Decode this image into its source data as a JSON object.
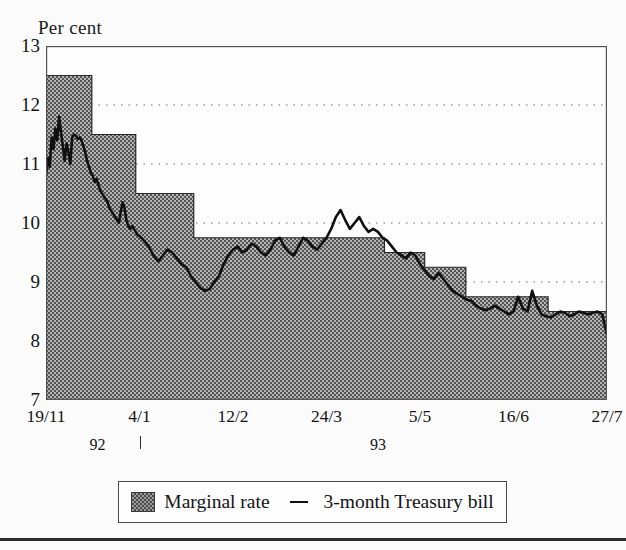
{
  "chart_data": {
    "type": "area",
    "title": "",
    "ylabel": "Per cent",
    "xlabel": "",
    "ylim": [
      7,
      13
    ],
    "yticks": [
      7,
      8,
      9,
      10,
      11,
      12,
      13
    ],
    "ytick_labels": [
      "7",
      "8",
      "9",
      "10",
      "11",
      "12",
      "13"
    ],
    "gridlines": [
      8,
      9,
      10,
      11,
      12
    ],
    "grid": "horizontal-dotted",
    "xtick_labels": [
      "19/11",
      "4/1",
      "12/2",
      "24/3",
      "5/5",
      "16/6",
      "27/7"
    ],
    "xtick_positions": [
      0,
      1,
      2,
      3,
      4,
      5,
      6
    ],
    "year_labels": [
      {
        "text": "92",
        "x": 0.55
      },
      {
        "text": "93",
        "x": 3.55
      }
    ],
    "year_tick_at": 1.0,
    "legend": {
      "position": "below-plot",
      "entries": [
        {
          "label": "Marginal rate",
          "marker": "filled-hatched-square"
        },
        {
          "label": "3-month Treasury bill",
          "marker": "line"
        }
      ]
    },
    "series": [
      {
        "name": "Marginal rate",
        "type": "step-area",
        "fill": "#a0a0a0",
        "steps": [
          {
            "x": 0.0,
            "value": 12.5
          },
          {
            "x": 0.49,
            "value": 11.5
          },
          {
            "x": 0.96,
            "value": 10.5
          },
          {
            "x": 1.58,
            "value": 9.75
          },
          {
            "x": 3.62,
            "value": 9.5
          },
          {
            "x": 4.05,
            "value": 9.25
          },
          {
            "x": 4.49,
            "value": 8.75
          },
          {
            "x": 5.37,
            "value": 8.5
          },
          {
            "x": 6.0,
            "value": 8.5
          }
        ]
      },
      {
        "name": "3-month Treasury bill",
        "type": "line",
        "color": "#101010",
        "x": [
          0.0,
          0.02,
          0.04,
          0.06,
          0.08,
          0.1,
          0.12,
          0.14,
          0.16,
          0.18,
          0.2,
          0.22,
          0.24,
          0.26,
          0.28,
          0.3,
          0.32,
          0.34,
          0.36,
          0.38,
          0.4,
          0.42,
          0.44,
          0.46,
          0.48,
          0.5,
          0.52,
          0.54,
          0.56,
          0.58,
          0.6,
          0.62,
          0.64,
          0.66,
          0.68,
          0.7,
          0.72,
          0.74,
          0.76,
          0.78,
          0.8,
          0.82,
          0.84,
          0.86,
          0.88,
          0.9,
          0.92,
          0.94,
          0.96,
          0.98,
          1.0,
          1.05,
          1.1,
          1.15,
          1.2,
          1.25,
          1.3,
          1.35,
          1.4,
          1.45,
          1.5,
          1.55,
          1.6,
          1.65,
          1.7,
          1.75,
          1.8,
          1.85,
          1.9,
          1.95,
          2.0,
          2.05,
          2.1,
          2.15,
          2.2,
          2.25,
          2.3,
          2.35,
          2.4,
          2.45,
          2.5,
          2.55,
          2.6,
          2.65,
          2.7,
          2.75,
          2.8,
          2.85,
          2.9,
          2.95,
          3.0,
          3.05,
          3.1,
          3.15,
          3.2,
          3.25,
          3.3,
          3.35,
          3.4,
          3.45,
          3.5,
          3.55,
          3.6,
          3.65,
          3.7,
          3.75,
          3.8,
          3.85,
          3.9,
          3.95,
          4.0,
          4.05,
          4.1,
          4.15,
          4.2,
          4.25,
          4.3,
          4.35,
          4.4,
          4.45,
          4.5,
          4.55,
          4.6,
          4.65,
          4.7,
          4.75,
          4.8,
          4.85,
          4.9,
          4.95,
          5.0,
          5.05,
          5.1,
          5.15,
          5.2,
          5.25,
          5.3,
          5.35,
          5.4,
          5.45,
          5.5,
          5.55,
          5.6,
          5.65,
          5.7,
          5.75,
          5.8,
          5.85,
          5.9,
          5.95,
          6.0
        ],
        "y": [
          10.8,
          11.1,
          10.95,
          11.45,
          11.25,
          11.6,
          11.4,
          11.8,
          11.55,
          11.3,
          11.05,
          11.35,
          11.2,
          11.0,
          11.45,
          11.5,
          11.48,
          11.42,
          11.45,
          11.4,
          11.3,
          11.2,
          11.05,
          10.95,
          10.85,
          10.8,
          10.7,
          10.75,
          10.65,
          10.55,
          10.5,
          10.45,
          10.4,
          10.35,
          10.25,
          10.2,
          10.15,
          10.1,
          10.05,
          10.0,
          10.2,
          10.35,
          10.25,
          10.05,
          9.95,
          9.9,
          9.95,
          9.9,
          9.85,
          9.8,
          9.78,
          9.7,
          9.6,
          9.45,
          9.35,
          9.45,
          9.55,
          9.5,
          9.4,
          9.3,
          9.25,
          9.1,
          9.0,
          8.9,
          8.85,
          8.88,
          9.0,
          9.1,
          9.3,
          9.45,
          9.55,
          9.6,
          9.5,
          9.55,
          9.65,
          9.6,
          9.5,
          9.45,
          9.55,
          9.7,
          9.75,
          9.6,
          9.5,
          9.45,
          9.6,
          9.75,
          9.7,
          9.6,
          9.55,
          9.65,
          9.75,
          9.9,
          10.1,
          10.22,
          10.05,
          9.9,
          10.0,
          10.1,
          9.95,
          9.85,
          9.9,
          9.85,
          9.75,
          9.7,
          9.6,
          9.5,
          9.45,
          9.4,
          9.5,
          9.45,
          9.3,
          9.2,
          9.1,
          9.05,
          9.15,
          9.05,
          8.95,
          8.85,
          8.8,
          8.75,
          8.7,
          8.68,
          8.6,
          8.55,
          8.52,
          8.55,
          8.6,
          8.55,
          8.5,
          8.45,
          8.5,
          8.75,
          8.55,
          8.5,
          8.85,
          8.6,
          8.45,
          8.42,
          8.4,
          8.45,
          8.5,
          8.48,
          8.42,
          8.45,
          8.5,
          8.48,
          8.45,
          8.48,
          8.5,
          8.45,
          8.1
        ]
      }
    ]
  },
  "axis": {
    "ylabel": "Per cent"
  },
  "legend": {
    "marginal_rate": "Marginal rate",
    "treasury_bill": "3-month Treasury bill"
  }
}
